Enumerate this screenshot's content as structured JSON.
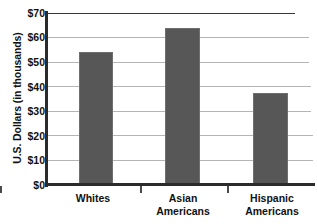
{
  "chart_data": {
    "type": "bar",
    "title": "",
    "xlabel": "",
    "ylabel": "U.S. Dollars (in thousands)",
    "categories": [
      "Whites",
      "Asian Americans",
      "Hispanic Americans"
    ],
    "values": [
      54,
      64,
      37.5
    ],
    "ylim": [
      0,
      70
    ],
    "yticks": [
      0,
      10,
      20,
      30,
      40,
      50,
      60,
      70
    ],
    "ytick_labels": [
      "$0",
      "$10",
      "$20",
      "$30",
      "$40",
      "$50",
      "$60",
      "$70"
    ],
    "grid": true,
    "legend": "none",
    "bar_color": "#575757",
    "gridline_color": "#b4b4b4",
    "axis_color": "#2b2b2b"
  },
  "axis": {
    "y_title": "U.S. Dollars (in thousands)"
  },
  "category_lines": [
    [
      "Whites"
    ],
    [
      "Asian",
      "Americans"
    ],
    [
      "Hispanic",
      "Americans"
    ]
  ]
}
